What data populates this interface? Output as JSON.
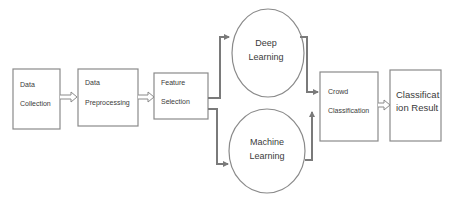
{
  "diagram": {
    "type": "flowchart",
    "nodes": [
      {
        "id": "data-collection",
        "shape": "rect",
        "lines": [
          "Data",
          "Collection"
        ]
      },
      {
        "id": "data-preprocessing",
        "shape": "rect",
        "lines": [
          "Data",
          "Preprocessing"
        ]
      },
      {
        "id": "feature-selection",
        "shape": "rect",
        "lines": [
          "Feature",
          "Selection"
        ]
      },
      {
        "id": "deep-learning",
        "shape": "ellipse",
        "lines": [
          "Deep",
          "Learning"
        ]
      },
      {
        "id": "machine-learning",
        "shape": "ellipse",
        "lines": [
          "Machine",
          "Learning"
        ]
      },
      {
        "id": "crowd-classification",
        "shape": "rect",
        "lines": [
          "Crowd",
          "Classification"
        ]
      },
      {
        "id": "classification-result",
        "shape": "rect",
        "lines": [
          "Classificat",
          "ion Result"
        ]
      }
    ],
    "edges": [
      {
        "from": "data-collection",
        "to": "data-preprocessing",
        "style": "hollow-arrow"
      },
      {
        "from": "data-preprocessing",
        "to": "feature-selection",
        "style": "hollow-arrow"
      },
      {
        "from": "feature-selection",
        "to": "deep-learning",
        "style": "elbow-arrow"
      },
      {
        "from": "feature-selection",
        "to": "machine-learning",
        "style": "elbow-arrow"
      },
      {
        "from": "deep-learning",
        "to": "crowd-classification",
        "style": "elbow-arrow"
      },
      {
        "from": "machine-learning",
        "to": "crowd-classification",
        "style": "elbow-arrow"
      },
      {
        "from": "crowd-classification",
        "to": "classification-result",
        "style": "hollow-arrow"
      }
    ],
    "colors": {
      "stroke": "#8a8a8a",
      "connector": "#7a7a7a",
      "text": "#3a3a3a",
      "background": "#ffffff"
    }
  }
}
